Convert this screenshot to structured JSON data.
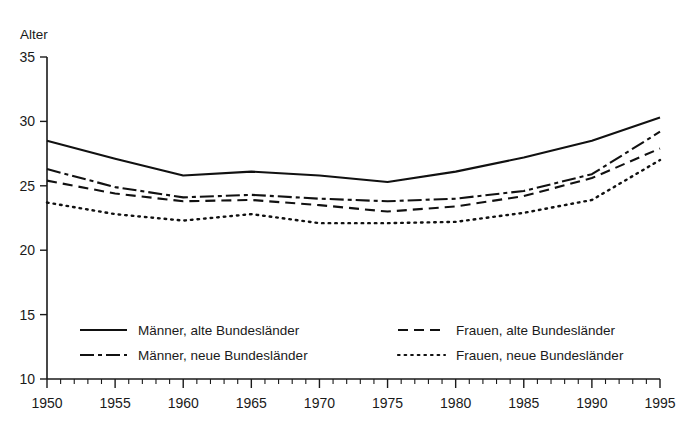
{
  "chart_data": {
    "type": "line",
    "title": "",
    "xlabel": "",
    "ylabel": "Alter",
    "xlim": [
      1950,
      1995
    ],
    "ylim": [
      10,
      35
    ],
    "grid": false,
    "legend_position": "inside-bottom",
    "x_ticks": [
      1950,
      1955,
      1960,
      1965,
      1970,
      1975,
      1980,
      1985,
      1990,
      1995
    ],
    "x_tick_labels": [
      "1950",
      "1955",
      "1960",
      "1965",
      "1970",
      "1975",
      "1980",
      "1985",
      "1990",
      "1995"
    ],
    "x_minor_tick_step": 1,
    "y_ticks": [
      10,
      15,
      20,
      25,
      30,
      35
    ],
    "y_tick_labels": [
      "10",
      "15",
      "20",
      "25",
      "30",
      "35"
    ],
    "x": [
      1950,
      1955,
      1960,
      1965,
      1970,
      1975,
      1980,
      1985,
      1990,
      1995
    ],
    "series": [
      {
        "name": "Männer, alte Bundesländer",
        "style": "solid",
        "color": "#111111",
        "values": [
          28.5,
          27.1,
          25.8,
          26.1,
          25.8,
          25.3,
          26.1,
          27.2,
          28.5,
          30.3
        ]
      },
      {
        "name": "Männer, neue Bundesländer",
        "style": "dash-dot",
        "color": "#111111",
        "values": [
          26.3,
          24.9,
          24.1,
          24.3,
          24.0,
          23.8,
          24.0,
          24.6,
          25.9,
          29.2
        ]
      },
      {
        "name": "Frauen, alte Bundesländer",
        "style": "dashed",
        "color": "#111111",
        "values": [
          25.4,
          24.4,
          23.8,
          23.9,
          23.5,
          23.0,
          23.4,
          24.2,
          25.6,
          27.9
        ]
      },
      {
        "name": "Frauen, neue Bundesländer",
        "style": "dotted",
        "color": "#111111",
        "values": [
          23.7,
          22.8,
          22.3,
          22.8,
          22.1,
          22.1,
          22.2,
          22.9,
          23.9,
          27.0
        ]
      }
    ]
  },
  "legend": {
    "entries": [
      {
        "label": "Männer, alte Bundesländer",
        "style": "solid"
      },
      {
        "label": "Männer, neue Bundesländer",
        "style": "dash-dot"
      },
      {
        "label": "Frauen, alte Bundesländer",
        "style": "dashed"
      },
      {
        "label": "Frauen, neue Bundesländer",
        "style": "dotted"
      }
    ]
  }
}
